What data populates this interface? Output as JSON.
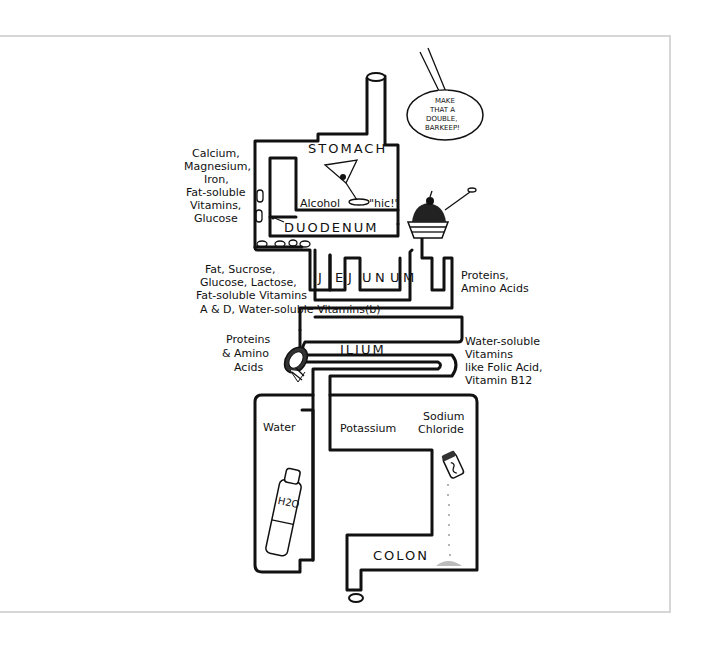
{
  "colors": {
    "ink": "#111111",
    "frame": "#d6d6d6",
    "background": "#ffffff"
  },
  "organs": {
    "stomach": "STOMACH",
    "duodenum": "DUODENUM",
    "jejunum": [
      "J",
      "E",
      "J",
      "U",
      "N",
      "U",
      "M"
    ],
    "ilium": "ILIUM",
    "colon": "COLON"
  },
  "stomach_contents": {
    "alcohol": "Alcohol",
    "hic": "\"hic!\""
  },
  "speech_bubble": [
    "MAKE",
    "THAT A",
    "DOUBLE,",
    "BARKEEP!"
  ],
  "labels": {
    "duodenum_absorbs": [
      "Calcium,",
      "Magnesium,",
      "Iron,",
      "Fat-soluble",
      "Vitamins,",
      "Glucose"
    ],
    "jejunum_absorbs_left": [
      "Fat, Sucrose,",
      "Glucose, Lactose,",
      "Fat-soluble Vitamins",
      "A & D,  Water-soluble Vitamins(b)"
    ],
    "jejunum_absorbs_right": [
      "Proteins,",
      "Amino Acids"
    ],
    "ilium_absorbs_left": [
      "Proteins",
      "& Amino",
      "Acids"
    ],
    "ilium_absorbs_right": [
      "Water-soluble",
      "Vitamins",
      "like Folic Acid,",
      "Vitamin B12"
    ],
    "colon_water": "Water",
    "colon_potassium": "Potassium",
    "colon_sodium": [
      "Sodium",
      "Chloride"
    ],
    "bottle_label": "H2O"
  },
  "illustrations": [
    "martini-glass",
    "pills",
    "ice-cream-sundae",
    "ham",
    "water-bottle",
    "salt-shaker"
  ]
}
